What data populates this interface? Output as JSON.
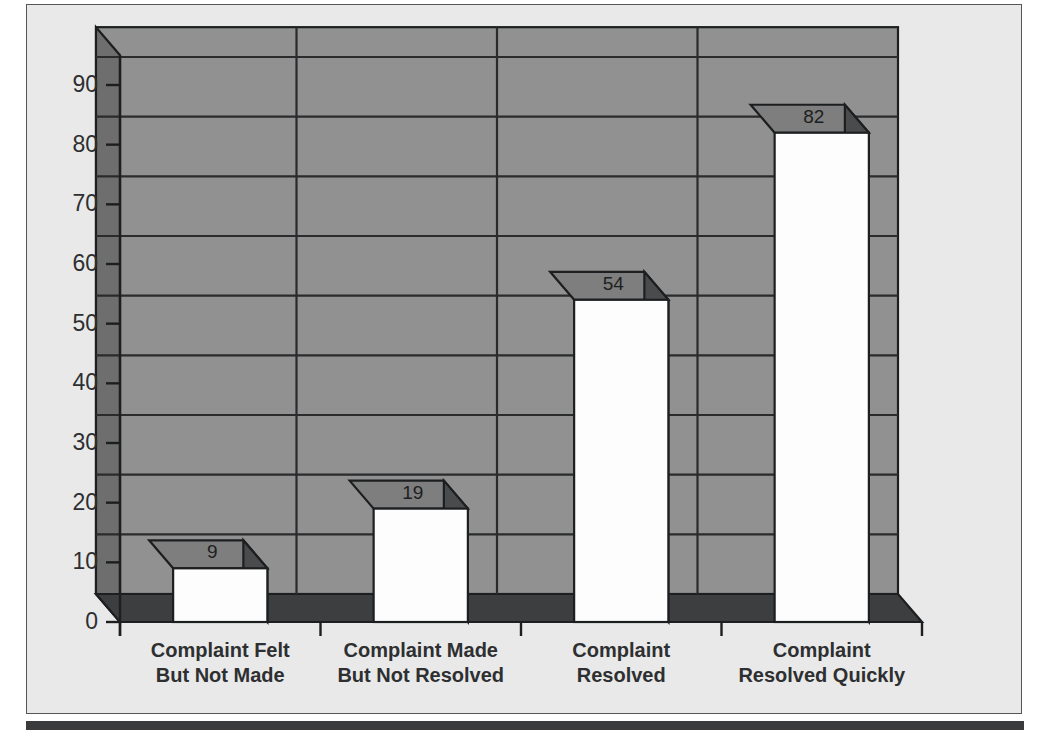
{
  "chart_data": {
    "type": "bar",
    "title": "",
    "subtitle": "",
    "xlabel": "",
    "ylabel": "",
    "categories": [
      "Complaint Felt\nBut Not Made",
      "Complaint Made\nBut Not Resolved",
      "Complaint\nResolved",
      "Complaint\nResolved Quickly"
    ],
    "category_lines": [
      [
        "Complaint Felt",
        "But Not Made"
      ],
      [
        "Complaint Made",
        "But Not Resolved"
      ],
      [
        "Complaint",
        "Resolved"
      ],
      [
        "Complaint",
        "Resolved Quickly"
      ]
    ],
    "values": [
      9,
      19,
      54,
      82
    ],
    "value_labels": [
      "9",
      "19",
      "54",
      "82"
    ],
    "ylim": [
      0,
      95
    ],
    "y_ticks": [
      0,
      10,
      20,
      30,
      40,
      50,
      60,
      70,
      80,
      90
    ],
    "y_tick_labels": [
      "0",
      "10",
      "20",
      "30",
      "40",
      "50",
      "60",
      "70",
      "80",
      "90"
    ],
    "grid": true,
    "legend": "none",
    "style": "3d-bar",
    "colors": {
      "figure_background": "#e9e9e9",
      "frame_border": "#55565a",
      "bottom_rule": "#3a3b3d",
      "wall_back": "#919191",
      "wall_left": "#6e6e6e",
      "floor": "#3d3e40",
      "gridline": "#2a2b2d",
      "bar_front": "#fdfdfd",
      "bar_side": "#4a4b4d",
      "bar_top": "#7e7e7e",
      "bar_outline": "#1d1e20",
      "text": "#2e2f31"
    }
  },
  "axis": {
    "y_axis_name": "value-axis",
    "x_axis_name": "category-axis"
  }
}
